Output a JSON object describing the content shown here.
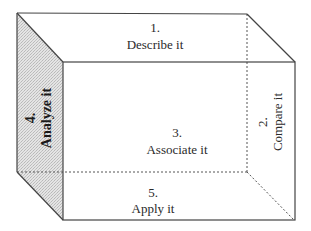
{
  "diagram": {
    "type": "cube",
    "colors": {
      "line": "#444444",
      "shade": "#d6d6d6",
      "background": "#ffffff",
      "text": "#2a2a2a"
    },
    "faces": {
      "top": {
        "number": "1.",
        "label": "Describe it"
      },
      "right": {
        "number": "2.",
        "label": "Compare it"
      },
      "front": {
        "number": "3.",
        "label": "Associate it"
      },
      "left": {
        "number": "4.",
        "label": "Analyze it"
      },
      "bottom": {
        "number": "5.",
        "label": "Apply it"
      }
    }
  }
}
